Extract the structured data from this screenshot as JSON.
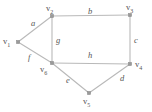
{
  "figure": {
    "type": "undirected-graph-diagram",
    "width": 152,
    "height": 112,
    "background_color": "#ffffff",
    "line_color": "#b9b9b9",
    "vertex_color": "#9a9a9a",
    "text_color": "#555555"
  },
  "vertices": [
    {
      "id": "v1",
      "name": "v",
      "sub": "1",
      "x": 18,
      "y": 42,
      "label_x": 3,
      "label_y": 37
    },
    {
      "id": "v2",
      "name": "v",
      "sub": "2",
      "x": 52,
      "y": 16,
      "label_x": 46,
      "label_y": 4
    },
    {
      "id": "v3",
      "name": "v",
      "sub": "3",
      "x": 130,
      "y": 15,
      "label_x": 126,
      "label_y": 3
    },
    {
      "id": "v4",
      "name": "v",
      "sub": "4",
      "x": 130,
      "y": 64,
      "label_x": 135,
      "label_y": 60
    },
    {
      "id": "v5",
      "name": "v",
      "sub": "5",
      "x": 89,
      "y": 93,
      "label_x": 83,
      "label_y": 97
    },
    {
      "id": "v6",
      "name": "v",
      "sub": "6",
      "x": 52,
      "y": 63,
      "label_x": 40,
      "label_y": 65
    }
  ],
  "edges": [
    {
      "id": "a",
      "label": "a",
      "from": "v1",
      "to": "v2",
      "label_x": 31,
      "label_y": 19
    },
    {
      "id": "b",
      "label": "b",
      "from": "v2",
      "to": "v3",
      "label_x": 88,
      "label_y": 7
    },
    {
      "id": "c",
      "label": "c",
      "from": "v3",
      "to": "v4",
      "label_x": 134,
      "label_y": 36
    },
    {
      "id": "d",
      "label": "d",
      "from": "v4",
      "to": "v5",
      "label_x": 120,
      "label_y": 74
    },
    {
      "id": "e",
      "label": "e",
      "from": "v5",
      "to": "v6",
      "label_x": 66,
      "label_y": 76
    },
    {
      "id": "f",
      "label": "f",
      "from": "v6",
      "to": "v1",
      "label_x": 28,
      "label_y": 53
    },
    {
      "id": "g",
      "label": "g",
      "from": "v2",
      "to": "v6",
      "label_x": 56,
      "label_y": 36
    },
    {
      "id": "h",
      "label": "h",
      "from": "v6",
      "to": "v4",
      "label_x": 88,
      "label_y": 51
    }
  ]
}
